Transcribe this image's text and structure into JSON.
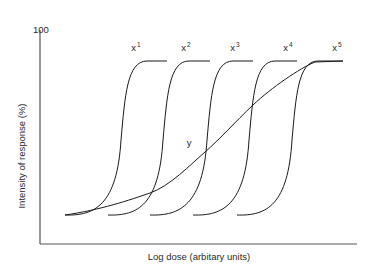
{
  "chart_data": {
    "type": "line",
    "title": "",
    "xlabel": "Log dose (arbitary units)",
    "ylabel": "Intensity of response (%)",
    "y_ticks": [
      "100"
    ],
    "ylim": [
      0,
      100
    ],
    "grid": false,
    "legend": "none (curves labelled inline)",
    "series": [
      {
        "name": "x",
        "power": "1",
        "shape": "steep sigmoid",
        "baseline_start_px": [
          65,
          215
        ],
        "midpoint_px": [
          121,
          140
        ],
        "plateau_end_px": [
          167,
          61
        ],
        "label_px": [
          136,
          47
        ]
      },
      {
        "name": "x",
        "power": "2",
        "shape": "steep sigmoid",
        "baseline_start_px": [
          108,
          215
        ],
        "midpoint_px": [
          163,
          140
        ],
        "plateau_end_px": [
          210,
          61
        ],
        "label_px": [
          186,
          47
        ]
      },
      {
        "name": "x",
        "power": "3",
        "shape": "steep sigmoid",
        "baseline_start_px": [
          150,
          215
        ],
        "midpoint_px": [
          207,
          140
        ],
        "plateau_end_px": [
          253,
          61
        ],
        "label_px": [
          235,
          47
        ]
      },
      {
        "name": "x",
        "power": "4",
        "shape": "steep sigmoid",
        "baseline_start_px": [
          193,
          215
        ],
        "midpoint_px": [
          249,
          140
        ],
        "plateau_end_px": [
          297,
          61
        ],
        "label_px": [
          288,
          47
        ]
      },
      {
        "name": "x",
        "power": "5",
        "shape": "steep sigmoid",
        "baseline_start_px": [
          237,
          215
        ],
        "midpoint_px": [
          292,
          140
        ],
        "plateau_end_px": [
          343,
          61
        ],
        "label_px": [
          337,
          47
        ]
      },
      {
        "name": "y",
        "power": "",
        "shape": "shallow sigmoid",
        "baseline_start_px": [
          65,
          215
        ],
        "points_px": [
          [
            65,
            215
          ],
          [
            150,
            193
          ],
          [
            205,
            152
          ],
          [
            253,
            105
          ],
          [
            315,
            62
          ],
          [
            343,
            61
          ]
        ],
        "label_px": [
          189,
          142
        ]
      }
    ],
    "annotation": "Curves x¹–x⁵ are parallel steep dose-response curves; y is a shallow curve spanning the same range"
  },
  "labels": {
    "y_tick_100": "100",
    "y_axis": "Intensity of response (%)",
    "x_axis": "Log dose (arbitary units)",
    "curve_base": "x",
    "curve_y": "y",
    "powers": [
      "1",
      "2",
      "3",
      "4",
      "5"
    ]
  },
  "colors": {
    "axis": "#555555",
    "curve": "#1a1a1a",
    "text": "#2a2a2a"
  }
}
